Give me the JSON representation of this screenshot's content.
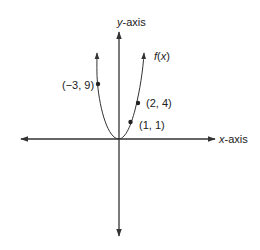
{
  "diagram": {
    "type": "function-graph",
    "function_label": "f(x)",
    "function_label_parts": {
      "f": "f",
      "open": "(",
      "x": "x",
      "close": ")"
    },
    "y_axis_label": {
      "var": "y",
      "suffix": "-axis"
    },
    "x_axis_label": {
      "var": "x",
      "suffix": "-axis"
    },
    "points": [
      {
        "label": "(−3, 9)",
        "x": -3,
        "y": 9
      },
      {
        "label": "(2, 4)",
        "x": 2,
        "y": 4
      },
      {
        "label": "(1, 1)",
        "x": 1,
        "y": 1
      }
    ],
    "colors": {
      "stroke": "#333333",
      "background": "#ffffff"
    }
  }
}
